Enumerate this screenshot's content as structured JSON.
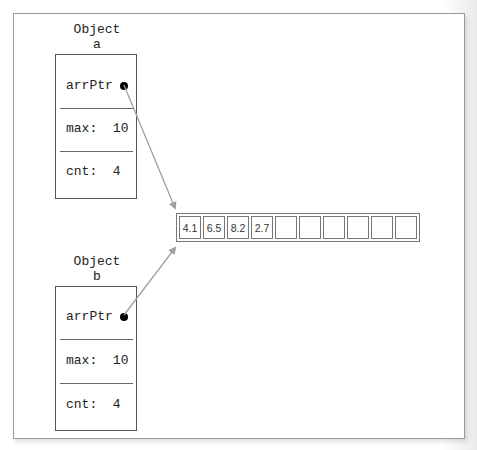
{
  "diagram": {
    "objects": [
      {
        "title_line1": "Object",
        "title_line2": "a",
        "fields": [
          {
            "label": "arrPtr",
            "value": ""
          },
          {
            "label": "max:",
            "value": "10"
          },
          {
            "label": "cnt:",
            "value": "4"
          }
        ]
      },
      {
        "title_line1": "Object",
        "title_line2": "b",
        "fields": [
          {
            "label": "arrPtr",
            "value": ""
          },
          {
            "label": "max:",
            "value": "10"
          },
          {
            "label": "cnt:",
            "value": "4"
          }
        ]
      }
    ],
    "array": {
      "cells": [
        "4.1",
        "6.5",
        "8.2",
        "2.7",
        "",
        "",
        "",
        "",
        "",
        ""
      ]
    },
    "colors": {
      "arrow": "#a0a0a0",
      "border": "#555555",
      "dot": "#000000"
    }
  }
}
